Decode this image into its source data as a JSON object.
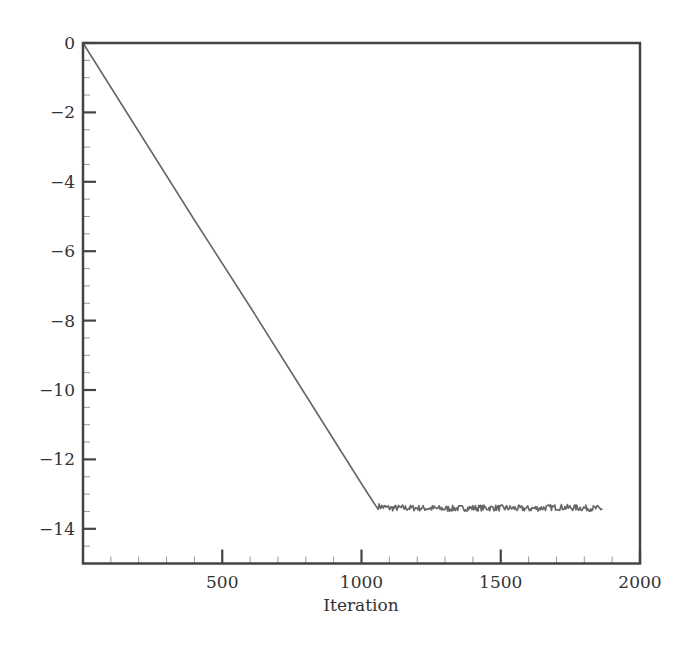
{
  "chart_data": {
    "type": "line",
    "title": "",
    "xlabel": "Iteration",
    "ylabel": "",
    "xlim": [
      0,
      2000
    ],
    "ylim": [
      -15,
      0
    ],
    "xticks": [
      500,
      1000,
      1500,
      2000
    ],
    "xtick_labels": [
      "500",
      "1000",
      "1500",
      "2000"
    ],
    "yticks": [
      0,
      -2,
      -4,
      -6,
      -8,
      -10,
      -12,
      -14
    ],
    "ytick_labels": [
      "0",
      "−2",
      "−4",
      "−6",
      "−8",
      "−10",
      "−12",
      "−14"
    ],
    "x_minor_step": 100,
    "y_minor_step": 0.5,
    "grid": false,
    "legend": null,
    "line_color": "#666666",
    "series": [
      {
        "name": "residual",
        "description": "Linear decrease from 0 at iteration 0 to about -13.3 near iteration 1050, then a noisy plateau around -13.4 until about iteration 1865",
        "x": [
          0,
          200,
          400,
          600,
          800,
          1000,
          1040,
          1060,
          1100,
          1200,
          1300,
          1400,
          1500,
          1600,
          1700,
          1800,
          1865
        ],
        "y": [
          0,
          -2.55,
          -5.1,
          -7.6,
          -10.15,
          -12.7,
          -13.2,
          -13.35,
          -13.4,
          -13.4,
          -13.42,
          -13.4,
          -13.4,
          -13.42,
          -13.38,
          -13.4,
          -13.42
        ]
      }
    ]
  }
}
